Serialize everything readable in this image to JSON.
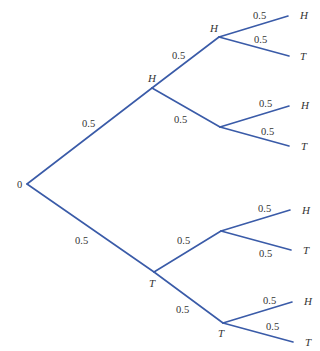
{
  "diagram": {
    "type": "probability-tree",
    "root": {
      "label": "0",
      "x": 27,
      "y": 184,
      "label_x": 17,
      "label_y": 188
    },
    "colors": {
      "edge": "#3a5ba8",
      "text": "#333333",
      "background": "#ffffff"
    },
    "nodes": [
      {
        "id": "H",
        "label": "H",
        "x": 152,
        "y": 88,
        "label_x": 148,
        "label_y": 82
      },
      {
        "id": "T",
        "label": "T",
        "x": 154,
        "y": 272,
        "label_x": 149,
        "label_y": 287
      },
      {
        "id": "HH",
        "label": "H",
        "x": 219,
        "y": 37,
        "label_x": 210,
        "label_y": 32
      },
      {
        "id": "HT",
        "label": "",
        "x": 220,
        "y": 127,
        "label_x": 0,
        "label_y": 0
      },
      {
        "id": "TH",
        "label": "",
        "x": 221,
        "y": 231,
        "label_x": 0,
        "label_y": 0
      },
      {
        "id": "TT",
        "label": "T",
        "x": 223,
        "y": 323,
        "label_x": 218,
        "label_y": 337
      }
    ],
    "edges": [
      {
        "from": [
          27,
          184
        ],
        "to": [
          152,
          88
        ],
        "prob": "0.5",
        "px": 82,
        "py": 127
      },
      {
        "from": [
          27,
          184
        ],
        "to": [
          154,
          272
        ],
        "prob": "0.5",
        "px": 75,
        "py": 244
      },
      {
        "from": [
          152,
          88
        ],
        "to": [
          219,
          37
        ],
        "prob": "0.5",
        "px": 172,
        "py": 59
      },
      {
        "from": [
          152,
          88
        ],
        "to": [
          220,
          127
        ],
        "prob": "0.5",
        "px": 174,
        "py": 123
      },
      {
        "from": [
          154,
          272
        ],
        "to": [
          221,
          231
        ],
        "prob": "0.5",
        "px": 177,
        "py": 244
      },
      {
        "from": [
          154,
          272
        ],
        "to": [
          223,
          323
        ],
        "prob": "0.5",
        "px": 176,
        "py": 313
      },
      {
        "from": [
          219,
          37
        ],
        "to": [
          288,
          16
        ],
        "prob": "0.5",
        "px": 253,
        "py": 19
      },
      {
        "from": [
          219,
          37
        ],
        "to": [
          289,
          56
        ],
        "prob": "0.5",
        "px": 254,
        "py": 43
      },
      {
        "from": [
          220,
          127
        ],
        "to": [
          289,
          106
        ],
        "prob": "0.5",
        "px": 259,
        "py": 107
      },
      {
        "from": [
          220,
          127
        ],
        "to": [
          289,
          146
        ],
        "prob": "0.5",
        "px": 261,
        "py": 135
      },
      {
        "from": [
          221,
          231
        ],
        "to": [
          290,
          210
        ],
        "prob": "0.5",
        "px": 258,
        "py": 212
      },
      {
        "from": [
          221,
          231
        ],
        "to": [
          291,
          250
        ],
        "prob": "0.5",
        "px": 259,
        "py": 257
      },
      {
        "from": [
          223,
          323
        ],
        "to": [
          292,
          302
        ],
        "prob": "0.5",
        "px": 263,
        "py": 304
      },
      {
        "from": [
          223,
          323
        ],
        "to": [
          293,
          342
        ],
        "prob": "0.5",
        "px": 266,
        "py": 330
      }
    ],
    "leaves": [
      {
        "label": "H",
        "x": 300,
        "y": 19
      },
      {
        "label": "T",
        "x": 300,
        "y": 60
      },
      {
        "label": "H",
        "x": 301,
        "y": 109
      },
      {
        "label": "T",
        "x": 301,
        "y": 150
      },
      {
        "label": "H",
        "x": 302,
        "y": 214
      },
      {
        "label": "T",
        "x": 303,
        "y": 254
      },
      {
        "label": "H",
        "x": 304,
        "y": 305
      },
      {
        "label": "T",
        "x": 305,
        "y": 346
      }
    ]
  }
}
